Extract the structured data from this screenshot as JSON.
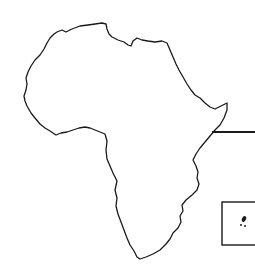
{
  "map": {
    "subject": "Outline map of Africa",
    "stroke_color": "#1a1a1a",
    "background_color": "#ffffff",
    "callout_line": {
      "label": ""
    },
    "inset": {
      "label": "",
      "content": "islands"
    }
  }
}
